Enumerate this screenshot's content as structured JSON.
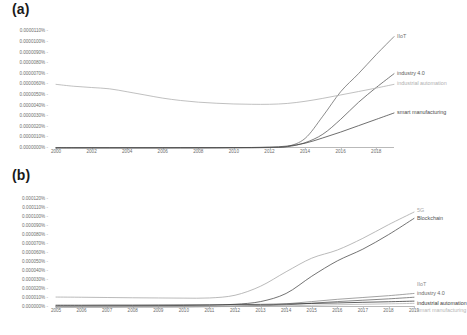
{
  "figure": {
    "panel_a_label": "(a)",
    "panel_b_label": "(b)"
  },
  "colors": {
    "iiot": "#6f6f6f",
    "industry40": "#5a5a5a",
    "industrial_automation": "#b0b0b0",
    "smart_manufacturing": "#4a4a4a",
    "fiveg": "#a8a8a8",
    "blockchain": "#4f4f4f",
    "axis": "#b9b9b9",
    "tick_text": "#6d6d6d"
  },
  "chart_data": [
    {
      "type": "line",
      "title": "(a)",
      "xlabel": "",
      "ylabel": "",
      "grid": false,
      "legend": "inline-right",
      "xlim": [
        2000,
        2019
      ],
      "ylim": [
        0.0,
        1.15e-05
      ],
      "xticks": [
        "2000",
        "2002",
        "2004",
        "2006",
        "2008",
        "2010",
        "2012",
        "2014",
        "2016",
        "2018"
      ],
      "xtick_values": [
        2000,
        2002,
        2004,
        2006,
        2008,
        2010,
        2012,
        2014,
        2016,
        2018
      ],
      "yticks": [
        "0.0000000%",
        "0.0000010%",
        "0.0000020%",
        "0.0000030%",
        "0.0000040%",
        "0.0000050%",
        "0.0000060%",
        "0.0000070%",
        "0.0000080%",
        "0.0000090%",
        "0.0000100%",
        "0.0000110%"
      ],
      "ytick_values": [
        0.0,
        1e-06,
        2e-06,
        3e-06,
        4e-06,
        5e-06,
        6e-06,
        7e-06,
        8e-06,
        9e-06,
        1e-05,
        1.1e-05
      ],
      "x": [
        2000,
        2001,
        2002,
        2003,
        2004,
        2005,
        2006,
        2007,
        2008,
        2009,
        2010,
        2011,
        2012,
        2013,
        2014,
        2015,
        2016,
        2017,
        2018,
        2019
      ],
      "series": [
        {
          "name": "IIoT",
          "color": "#6f6f6f",
          "label_year": 2019,
          "values": [
            2e-08,
            2e-08,
            2e-08,
            2e-08,
            2e-08,
            2e-08,
            2e-08,
            2e-08,
            2e-08,
            3e-08,
            3e-08,
            4e-08,
            6e-08,
            1.5e-07,
            9e-07,
            3e-06,
            5.3e-06,
            7e-06,
            8.8e-06,
            1.05e-05
          ]
        },
        {
          "name": "industry 4.0",
          "color": "#5a5a5a",
          "label_year": 2019,
          "values": [
            1e-08,
            1e-08,
            1e-08,
            1e-08,
            1e-08,
            1e-08,
            1e-08,
            1e-08,
            1e-08,
            1e-08,
            2e-08,
            2e-08,
            4e-08,
            1.2e-07,
            5e-07,
            1.3e-06,
            2.7e-06,
            4.3e-06,
            5.7e-06,
            7e-06
          ]
        },
        {
          "name": "industrial automation",
          "color": "#b0b0b0",
          "label_year": 2019,
          "values": [
            6e-06,
            5.82e-06,
            5.7e-06,
            5.58e-06,
            5.3e-06,
            5e-06,
            4.7e-06,
            4.48e-06,
            4.32e-06,
            4.22e-06,
            4.15e-06,
            4.12e-06,
            4.12e-06,
            4.2e-06,
            4.4e-06,
            4.68e-06,
            5e-06,
            5.32e-06,
            5.65e-06,
            6e-06
          ]
        },
        {
          "name": "smart manufacturing",
          "color": "#4a4a4a",
          "label_year": 2019,
          "values": [
            2e-08,
            2e-08,
            2e-08,
            2e-08,
            2e-08,
            2e-08,
            2e-08,
            3e-08,
            3e-08,
            3e-08,
            4e-08,
            5e-08,
            8e-08,
            1.8e-07,
            4.5e-07,
            9.5e-07,
            1.5e-06,
            2.1e-06,
            2.7e-06,
            3.3e-06
          ]
        }
      ]
    },
    {
      "type": "line",
      "title": "(b)",
      "xlabel": "",
      "ylabel": "",
      "grid": false,
      "legend": "inline-right",
      "xlim": [
        2005,
        2019
      ],
      "ylim": [
        0.0,
        0.000125
      ],
      "xticks": [
        "2005",
        "2006",
        "2007",
        "2008",
        "2009",
        "2010",
        "2011",
        "2012",
        "2013",
        "2014",
        "2015",
        "2016",
        "2017",
        "2018",
        "2019"
      ],
      "xtick_values": [
        2005,
        2006,
        2007,
        2008,
        2009,
        2010,
        2011,
        2012,
        2013,
        2014,
        2015,
        2016,
        2017,
        2018,
        2019
      ],
      "yticks": [
        "0.000000%",
        "0.000010%",
        "0.000020%",
        "0.000030%",
        "0.000040%",
        "0.000050%",
        "0.000060%",
        "0.000070%",
        "0.000080%",
        "0.000090%",
        "0.000100%",
        "0.000110%",
        "0.000120%"
      ],
      "ytick_values": [
        0.0,
        1e-05,
        2e-05,
        3e-05,
        4e-05,
        5e-05,
        6e-05,
        7e-05,
        8e-05,
        9e-05,
        0.0001,
        0.00011,
        0.00012
      ],
      "x": [
        2005,
        2006,
        2007,
        2008,
        2009,
        2010,
        2011,
        2012,
        2013,
        2014,
        2015,
        2016,
        2017,
        2018,
        2019
      ],
      "series": [
        {
          "name": "5G",
          "color": "#a8a8a8",
          "label_year": 2019,
          "values": [
            1.1e-05,
            1.08e-05,
            1.05e-05,
            1.02e-05,
            1e-05,
            9.8e-06,
            1e-05,
            1.3e-05,
            2.3e-05,
            3.9e-05,
            5.4e-05,
            6.3e-05,
            7.6e-05,
            9.1e-05,
            0.000105
          ]
        },
        {
          "name": "Blockchain",
          "color": "#4f4f4f",
          "label_year": 2019,
          "values": [
            1.2e-06,
            1.2e-06,
            1.3e-06,
            1.4e-06,
            1.5e-06,
            1.7e-06,
            2e-06,
            3e-06,
            6e-06,
            1.5e-05,
            3.4e-05,
            5.1e-05,
            6.4e-05,
            8e-05,
            9.8e-05
          ]
        },
        {
          "name": "IIoT",
          "color": "#8c8c8c",
          "label_year": 2019,
          "values": [
            2e-07,
            2e-07,
            2e-07,
            3e-07,
            3e-07,
            4e-07,
            6e-07,
            1e-06,
            1.8e-06,
            3.5e-06,
            6e-06,
            8.5e-06,
            1.05e-05,
            1.25e-05,
            1.5e-05
          ]
        },
        {
          "name": "industry 4.0",
          "color": "#6a6a6a",
          "label_year": 2019,
          "values": [
            1e-07,
            1e-07,
            1e-07,
            2e-07,
            2e-07,
            2e-07,
            4e-07,
            7e-07,
            1.2e-06,
            2.4e-06,
            4.2e-06,
            6e-06,
            7.5e-06,
            9e-06,
            1.08e-05
          ]
        },
        {
          "name": "industrial automation",
          "color": "#3a3a3a",
          "label_year": 2019,
          "values": [
            2e-06,
            2e-06,
            2.1e-06,
            2.1e-06,
            2.2e-06,
            2.3e-06,
            2.4e-06,
            2.6e-06,
            2.9e-06,
            3.3e-06,
            3.9e-06,
            4.5e-06,
            5.2e-06,
            5.8e-06,
            6.5e-06
          ]
        },
        {
          "name": "smart manufacturing",
          "color": "#b5b5b5",
          "label_year": 2019,
          "values": [
            2e-07,
            2e-07,
            2e-07,
            2e-07,
            3e-07,
            3e-07,
            4e-07,
            5e-07,
            8e-07,
            1.3e-06,
            1.9e-06,
            2.5e-06,
            3e-06,
            3.5e-06,
            4e-06
          ]
        }
      ]
    }
  ]
}
